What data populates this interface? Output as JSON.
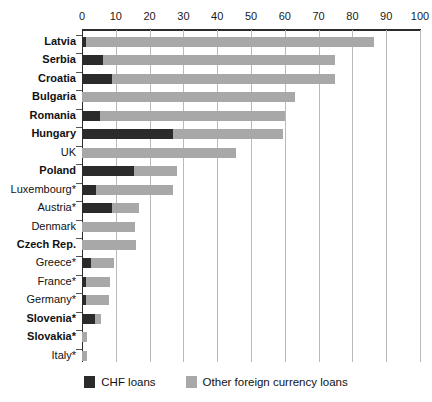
{
  "chart_data": {
    "type": "bar",
    "orientation": "horizontal",
    "stacked": true,
    "title": "",
    "subtitle": "",
    "xlabel": "",
    "ylabel": "",
    "xlim": [
      0,
      100
    ],
    "xticks": [
      0,
      10,
      20,
      30,
      40,
      50,
      60,
      70,
      80,
      90,
      100
    ],
    "xticklabels": [
      "0",
      "10",
      "20",
      "30",
      "40",
      "50",
      "60",
      "70",
      "80",
      "90",
      "100"
    ],
    "grid": true,
    "grid_axis": "x",
    "legend_position": "bottom",
    "categories": [
      "Latvia",
      "Serbia",
      "Croatia",
      "Bulgaria",
      "Romania",
      "Hungary",
      "UK",
      "Poland",
      "Luxembourg*",
      "Austria*",
      "Denmark",
      "Czech Rep.",
      "Greece*",
      "France*",
      "Germany*",
      "Slovenia*",
      "Slovakia*",
      "Italy*"
    ],
    "category_emphasis": [
      true,
      true,
      true,
      true,
      true,
      true,
      false,
      true,
      false,
      false,
      false,
      true,
      false,
      false,
      false,
      true,
      true,
      false
    ],
    "series": [
      {
        "name": "CHF loans",
        "color": "#2b2b2b",
        "values": [
          1.3,
          6.2,
          9.0,
          0.0,
          5.2,
          27.0,
          0.0,
          15.5,
          4.2,
          9.0,
          0.0,
          0.0,
          2.6,
          1.2,
          1.2,
          3.8,
          0.0,
          0.0
        ]
      },
      {
        "name": "Other foreign currency loans",
        "color": "#a8a8a8",
        "values": [
          85.1,
          68.8,
          66.0,
          63.0,
          55.0,
          32.5,
          45.5,
          12.5,
          22.8,
          7.8,
          15.8,
          16.0,
          6.9,
          7.1,
          6.8,
          1.7,
          1.6,
          1.5
        ]
      }
    ],
    "totals": [
      86.4,
      75.0,
      75.0,
      63.0,
      60.2,
      59.5,
      45.5,
      28.0,
      27.0,
      16.8,
      15.8,
      16.0,
      9.5,
      8.3,
      8.0,
      5.5,
      1.6,
      1.5
    ]
  },
  "legend": {
    "entries": [
      {
        "label": "CHF loans",
        "swatch": "chf-swatch"
      },
      {
        "label": "Other foreign currency loans",
        "swatch": "other-currency-swatch"
      }
    ]
  }
}
